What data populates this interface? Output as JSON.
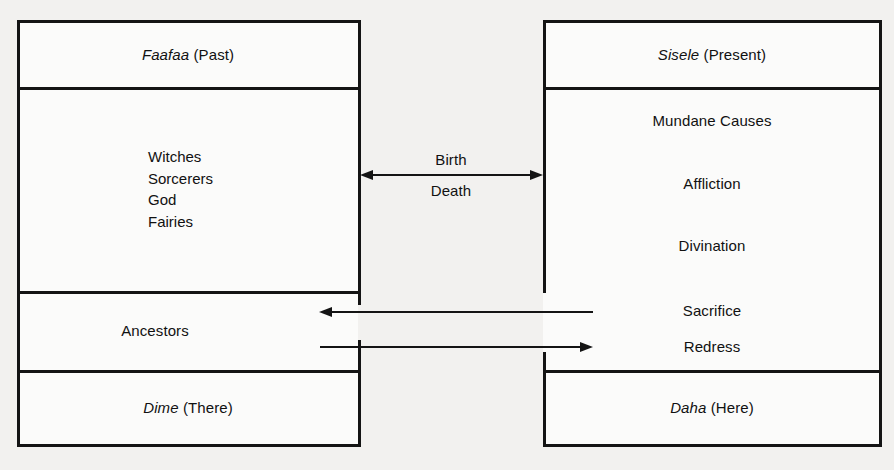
{
  "diagram": {
    "title_alt": "Faafaa (Past) / Sisele (Present) cosmological diagram",
    "colors": {
      "background": "#f2f1ef",
      "panel": "#fbfbfa",
      "ink": "#141414",
      "text": "#111111"
    }
  },
  "left_box": {
    "header": {
      "term": "Faafaa",
      "gloss": "(Past)"
    },
    "beings": [
      "Witches",
      "Sorcerers",
      "God",
      "Fairies"
    ],
    "middle_row": "Ancestors",
    "footer": {
      "term": "Dime",
      "gloss": "(There)"
    }
  },
  "right_box": {
    "header": {
      "term": "Sisele",
      "gloss": "(Present)"
    },
    "items": [
      "Mundane Causes",
      "Affliction",
      "Divination",
      "Sacrifice",
      "Redress"
    ],
    "footer": {
      "term": "Daha",
      "gloss": "(Here)"
    }
  },
  "connectors": {
    "center_arrow": {
      "upper_label": "Birth",
      "lower_label": "Death",
      "direction": "bidirectional"
    },
    "lower_arrows": [
      {
        "direction": "left",
        "from": "right_box",
        "to": "left_box"
      },
      {
        "direction": "right",
        "from": "left_box",
        "to": "right_box"
      }
    ]
  }
}
